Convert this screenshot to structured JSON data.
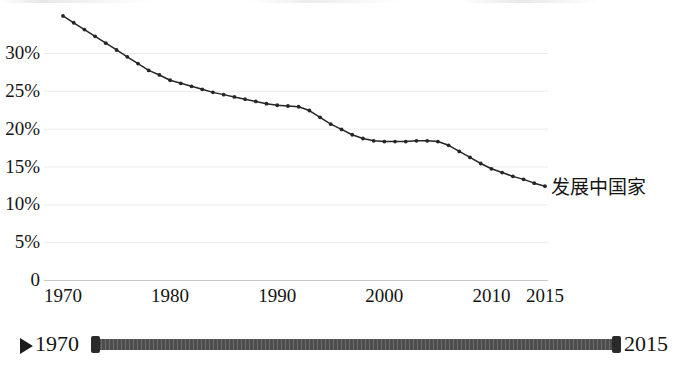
{
  "chart_data": {
    "type": "line",
    "title": "",
    "subtitle": "",
    "xlabel": "",
    "ylabel": "",
    "xlim": [
      1970,
      2015
    ],
    "ylim": [
      0,
      35
    ],
    "grid": true,
    "grid_axis": "y",
    "legend_position": "end-of-line",
    "y_tick_labels": [
      "30%",
      "25%",
      "20%",
      "15%",
      "10%",
      "5%",
      "0"
    ],
    "y_tick_values": [
      30,
      25,
      20,
      15,
      10,
      5,
      0
    ],
    "x_tick_labels": [
      "1970",
      "1980",
      "1990",
      "2000",
      "2010",
      "2015"
    ],
    "x_tick_values": [
      1970,
      1980,
      1990,
      2000,
      2010,
      2015
    ],
    "series": [
      {
        "name": "发展中国家",
        "color": "#262626",
        "marker": "dot",
        "x": [
          1970,
          1971,
          1972,
          1973,
          1974,
          1975,
          1976,
          1977,
          1978,
          1979,
          1980,
          1981,
          1982,
          1983,
          1984,
          1985,
          1986,
          1987,
          1988,
          1989,
          1990,
          1991,
          1992,
          1993,
          1994,
          1995,
          1996,
          1997,
          1998,
          1999,
          2000,
          2001,
          2002,
          2003,
          2004,
          2005,
          2006,
          2007,
          2008,
          2009,
          2010,
          2011,
          2012,
          2013,
          2014,
          2015
        ],
        "values": [
          34.9,
          34.0,
          33.1,
          32.2,
          31.3,
          30.4,
          29.5,
          28.6,
          27.7,
          27.1,
          26.4,
          26.0,
          25.6,
          25.2,
          24.8,
          24.5,
          24.2,
          23.9,
          23.6,
          23.3,
          23.1,
          23.0,
          22.9,
          22.4,
          21.5,
          20.6,
          19.9,
          19.2,
          18.7,
          18.4,
          18.3,
          18.3,
          18.3,
          18.4,
          18.4,
          18.3,
          17.8,
          17.0,
          16.2,
          15.4,
          14.7,
          14.2,
          13.7,
          13.3,
          12.8,
          12.4
        ]
      }
    ]
  },
  "series_label": {
    "text": "发展中国家"
  },
  "slider": {
    "play_label": "play",
    "start_label": "1970",
    "end_label": "2015"
  }
}
